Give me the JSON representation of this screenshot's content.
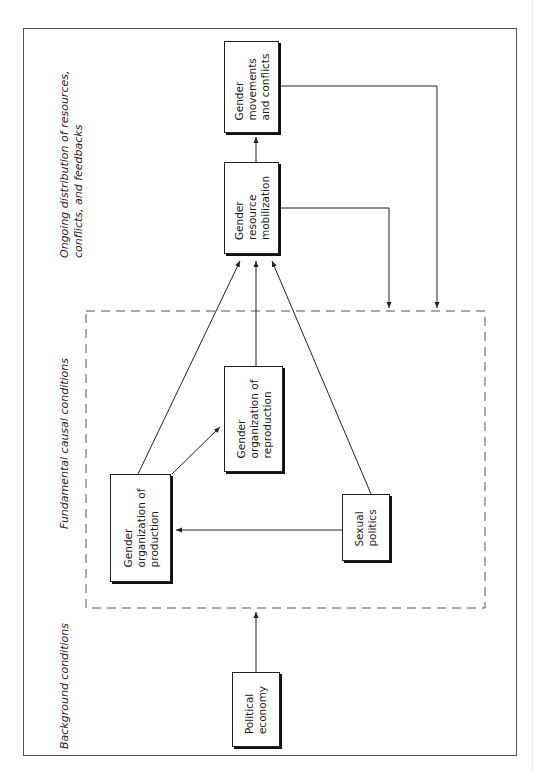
{
  "sections": {
    "ongoing": "Ongoing distribution of resources,\nconflicts, and feedbacks",
    "fundamental": "Fundamental causal conditions",
    "background": "Background conditions"
  },
  "boxes": {
    "movements": "Gender\nmovements\nand conflicts",
    "mobilization": "Gender\nresource\nmobilization",
    "reproduction": "Gender\norganization of\nreproduction",
    "production": "Gender\norganization of\nproduction",
    "sexual_politics": "Sexual\npolitics",
    "political_economy": "Political\neconomy"
  },
  "edges": [
    {
      "from": "political_economy",
      "to": "fundamental_causal_conditions"
    },
    {
      "from": "sexual_politics",
      "to": "production"
    },
    {
      "from": "production",
      "to": "reproduction"
    },
    {
      "from": "production",
      "to": "mobilization"
    },
    {
      "from": "reproduction",
      "to": "mobilization"
    },
    {
      "from": "sexual_politics",
      "to": "mobilization"
    },
    {
      "from": "mobilization",
      "to": "movements"
    },
    {
      "from": "mobilization",
      "to": "fundamental_causal_conditions",
      "type": "feedback"
    },
    {
      "from": "movements",
      "to": "fundamental_causal_conditions",
      "type": "feedback"
    }
  ],
  "colors": {
    "line": "#222222",
    "frame": "#555555",
    "dashed": "#555555"
  }
}
